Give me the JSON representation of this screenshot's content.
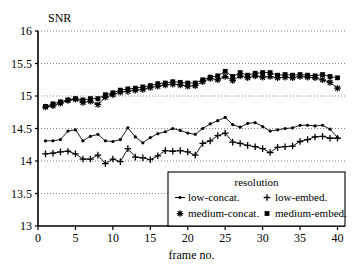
{
  "chart_data": {
    "type": "line",
    "title": "",
    "ylabel": "SNR",
    "xlabel": "frame no.",
    "xlim": [
      0,
      41
    ],
    "ylim": [
      13,
      16
    ],
    "xticks": [
      0,
      5,
      10,
      15,
      20,
      25,
      30,
      35,
      40
    ],
    "yticks": [
      13,
      13.5,
      14,
      14.5,
      15,
      15.5,
      16
    ],
    "ytick_labels": [
      "13",
      "13.5",
      "14",
      "14.5",
      "15",
      "15.5",
      "16"
    ],
    "xtick_labels": [
      "0",
      "5",
      "10",
      "15",
      "20",
      "25",
      "30",
      "35",
      "40"
    ],
    "grid": true,
    "grid_style": "dotted-horizontal",
    "legend_title": "resolution",
    "legend_position": "lower-right",
    "x": [
      1,
      2,
      3,
      4,
      5,
      6,
      7,
      8,
      9,
      10,
      11,
      12,
      13,
      14,
      15,
      16,
      17,
      18,
      19,
      20,
      21,
      22,
      23,
      24,
      25,
      26,
      27,
      28,
      29,
      30,
      31,
      32,
      33,
      34,
      35,
      36,
      37,
      38,
      39,
      40
    ],
    "series": [
      {
        "name": "low-concat.",
        "marker": "dot-line",
        "marker_symbol": "•",
        "color": "#000000",
        "values": [
          14.31,
          14.31,
          14.33,
          14.46,
          14.48,
          14.31,
          14.38,
          14.41,
          14.31,
          14.3,
          14.33,
          14.51,
          14.37,
          14.28,
          14.36,
          14.42,
          14.45,
          14.5,
          14.47,
          14.43,
          14.41,
          14.5,
          14.57,
          14.62,
          14.67,
          14.56,
          14.52,
          14.58,
          14.59,
          14.53,
          14.46,
          14.48,
          14.5,
          14.51,
          14.55,
          14.55,
          14.54,
          14.55,
          14.49,
          14.36
        ]
      },
      {
        "name": "low-embed.",
        "marker": "plus",
        "marker_symbol": "+",
        "color": "#000000",
        "values": [
          14.11,
          14.12,
          14.14,
          14.15,
          14.11,
          14.03,
          14.03,
          14.09,
          13.96,
          14.03,
          13.99,
          14.19,
          14.06,
          14.05,
          14.02,
          14.08,
          14.16,
          14.15,
          14.16,
          14.14,
          14.09,
          14.27,
          14.31,
          14.39,
          14.43,
          14.29,
          14.27,
          14.24,
          14.22,
          14.19,
          14.13,
          14.21,
          14.22,
          14.23,
          14.3,
          14.33,
          14.37,
          14.38,
          14.35,
          14.35
        ]
      },
      {
        "name": "medium-concat.",
        "marker": "asterisk",
        "marker_symbol": "✳",
        "color": "#000000",
        "values": [
          14.83,
          14.85,
          14.89,
          14.93,
          14.95,
          14.9,
          14.92,
          14.87,
          14.98,
          15.02,
          15.06,
          15.07,
          15.09,
          15.1,
          15.13,
          15.15,
          15.17,
          15.18,
          15.17,
          15.15,
          15.16,
          15.22,
          15.27,
          15.25,
          15.3,
          15.24,
          15.31,
          15.28,
          15.31,
          15.29,
          15.3,
          15.28,
          15.29,
          15.28,
          15.3,
          15.29,
          15.28,
          15.25,
          15.21,
          15.12
        ]
      },
      {
        "name": "medium-embed.",
        "marker": "square",
        "marker_symbol": "■",
        "color": "#000000",
        "values": [
          14.84,
          14.88,
          14.91,
          14.94,
          14.96,
          14.94,
          14.96,
          14.96,
          15.02,
          15.05,
          15.09,
          15.11,
          15.12,
          15.14,
          15.16,
          15.19,
          15.2,
          15.22,
          15.21,
          15.2,
          15.2,
          15.25,
          15.29,
          15.31,
          15.38,
          15.3,
          15.36,
          15.32,
          15.35,
          15.36,
          15.36,
          15.32,
          15.33,
          15.32,
          15.33,
          15.32,
          15.31,
          15.33,
          15.3,
          15.28
        ]
      }
    ]
  },
  "legend": {
    "title": "resolution",
    "entries": [
      {
        "label": "low-concat.",
        "symbol": "dot"
      },
      {
        "label": "low-embed.",
        "symbol": "plus"
      },
      {
        "label": "medium-concat.",
        "symbol": "asterisk"
      },
      {
        "label": "medium-embed.",
        "symbol": "square"
      }
    ]
  }
}
